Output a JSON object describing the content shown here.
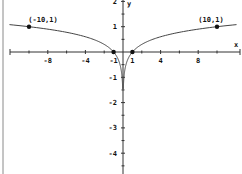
{
  "chart_data": {
    "type": "line",
    "title": "",
    "function": "y = log|x|",
    "xlabel": "x",
    "ylabel": "y",
    "xlim": [
      -11.5,
      12.5
    ],
    "ylim": [
      -5,
      2
    ],
    "grid": false,
    "x_ticks": [
      -8,
      -4,
      -1,
      1,
      4,
      8
    ],
    "x_tick_labels": [
      "-8",
      "-4",
      "-1",
      "1",
      "4",
      "8"
    ],
    "x_minor_ticks": [
      -10,
      -6,
      -2,
      2,
      6,
      10
    ],
    "y_ticks": [
      2,
      1,
      -1,
      -2,
      -3,
      -4
    ],
    "y_tick_labels": [
      "2",
      "1",
      "-1",
      "-2",
      "-3",
      "-4"
    ],
    "series": [
      {
        "name": "y = log|x| (x<0)",
        "x": [
          -12,
          -10,
          -8,
          -6,
          -4,
          -2,
          -1,
          -0.5,
          -0.2,
          -0.1,
          -0.05
        ],
        "y": [
          1.08,
          1,
          0.9,
          0.78,
          0.6,
          0.3,
          0,
          -0.3,
          -0.7,
          -1,
          -1.3
        ]
      },
      {
        "name": "y = log|x| (x>0)",
        "x": [
          0.05,
          0.1,
          0.2,
          0.5,
          1,
          2,
          4,
          6,
          8,
          10,
          12
        ],
        "y": [
          -1.3,
          -1,
          -0.7,
          -0.3,
          0,
          0.3,
          0.6,
          0.78,
          0.9,
          1,
          1.08
        ]
      }
    ],
    "points": [
      {
        "x": -10,
        "y": 1,
        "label": "(-10,1)"
      },
      {
        "x": 10,
        "y": 1,
        "label": "(10,1)"
      },
      {
        "x": -1,
        "y": 0,
        "label": ""
      },
      {
        "x": 1,
        "y": 0,
        "label": ""
      }
    ],
    "annotations": [
      "(-10,1)",
      "(10,1)"
    ],
    "colors": {
      "axis": "#333333",
      "curve": "#444444",
      "point": "#111111",
      "border": "#888888"
    }
  }
}
